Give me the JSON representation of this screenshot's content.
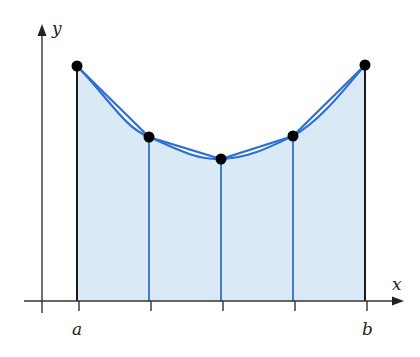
{
  "diagram": {
    "type": "trapezoidal-rule-approximation",
    "axes": {
      "x_label": "x",
      "y_label": "y"
    },
    "interval": {
      "left_label": "a",
      "right_label": "b"
    },
    "subintervals": 4,
    "points": [
      {
        "x": 77,
        "y": 66
      },
      {
        "x": 149,
        "y": 137
      },
      {
        "x": 221,
        "y": 159
      },
      {
        "x": 293,
        "y": 136
      },
      {
        "x": 365,
        "y": 65
      }
    ],
    "colors": {
      "fill": "#d9e9f6",
      "curve": "#2f6fd1",
      "partition_lines": "#2f6fd1",
      "bound_lines": "#1a1a1a",
      "points": "#000000",
      "axes": "#333333"
    }
  }
}
